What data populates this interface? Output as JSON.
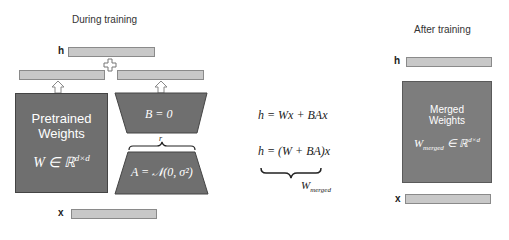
{
  "left_panel": {
    "title": "During training",
    "h_label": "h",
    "x_label": "x",
    "plus_symbol": "+",
    "pretrained": {
      "line1": "Pretrained",
      "line2": "Weights",
      "formula_main": "W ∈ ℝ",
      "formula_sup": "d×d"
    },
    "b_matrix": {
      "formula": "B = 0"
    },
    "a_matrix": {
      "formula": "A = 𝒩(0, σ²)",
      "rank_label": "r"
    }
  },
  "middle": {
    "eq1": "h = Wx + BAx",
    "eq2": "h = (W + BA)x",
    "brace_label_main": "W",
    "brace_label_sub": "merged"
  },
  "right_panel": {
    "title": "After training",
    "h_label": "h",
    "x_label": "x",
    "merged": {
      "line1": "Merged",
      "line2": "Weights",
      "formula_main": "W",
      "formula_sub": "merged",
      "formula_rest": " ∈ ℝ",
      "formula_sup": "d×d"
    }
  },
  "colors": {
    "bar_fill": "#c8c8c8",
    "box_fill": "#6f6f6f",
    "text": "#222222"
  }
}
